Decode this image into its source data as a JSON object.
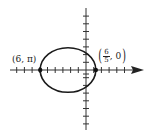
{
  "chart_data": {
    "type": "line",
    "subtype": "polar-ellipse",
    "title": "",
    "xlabel": "",
    "ylabel": "",
    "grid": false,
    "legend": null,
    "axes": {
      "x_axis_arrow": true,
      "tick_spacing_units": 1,
      "x_ticks_left_of_origin": 10,
      "x_ticks_right_of_origin": 6,
      "y_ticks_above_origin": 8,
      "y_ticks_below_origin": 8
    },
    "curve": {
      "shape": "ellipse",
      "left_vertex": {
        "x": -6,
        "y": 0
      },
      "right_vertex": {
        "x": 1.2,
        "y": 0
      },
      "center": {
        "x": -2.4,
        "y": 0
      },
      "semi_major_axis": 3.6,
      "semi_minor_axis": 3.1
    },
    "points": [
      {
        "polar": "(6, π)",
        "cartesian": {
          "x": -6,
          "y": 0
        }
      },
      {
        "polar": "(6/5, 0)",
        "cartesian": {
          "x": 1.2,
          "y": 0
        }
      }
    ],
    "annotations": [
      {
        "text": "(6, π)",
        "position": "above-left of left vertex"
      },
      {
        "text": "(6/5, 0)",
        "position": "above-right of right vertex"
      }
    ]
  },
  "labels": {
    "left_point": "(6, π)",
    "right_open": "(",
    "right_num": "6",
    "right_den": "5",
    "right_rest": ", 0",
    "right_close": ")"
  },
  "colors": {
    "axis": "#333333",
    "curve": "#1a1a1a",
    "points": "#111111"
  }
}
